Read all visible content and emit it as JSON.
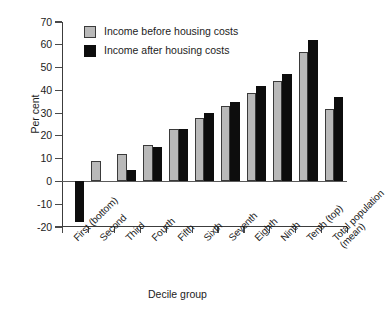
{
  "chart_data": {
    "type": "bar",
    "title": "",
    "xlabel": "Decile group",
    "ylabel": "Per cent",
    "ylim": [
      -20,
      70
    ],
    "yticks": [
      -20,
      -10,
      0,
      10,
      20,
      30,
      40,
      50,
      60,
      70
    ],
    "ytick_labels": [
      "-20",
      "-10",
      "0",
      "10",
      "20",
      "30",
      "40",
      "50",
      "60",
      "70"
    ],
    "grid": false,
    "legend_position": "top-left",
    "categories": [
      "First (bottom)",
      "Second",
      "Third",
      "Fourth",
      "Fifth",
      "Sixth",
      "Seventh",
      "Eighth",
      "Ninth",
      "Tenth (top)",
      "Total population (mean)"
    ],
    "series": [
      {
        "name": "Income before housing costs",
        "color": "#b9b9b9",
        "values": [
          0,
          9,
          12,
          16,
          23,
          28,
          33,
          39,
          44,
          57,
          32
        ]
      },
      {
        "name": "Income after housing costs",
        "color": "#0d0d0d",
        "values": [
          -18,
          0,
          5,
          15,
          23,
          30,
          35,
          42,
          47,
          62,
          37
        ]
      }
    ]
  },
  "legend": {
    "items": [
      {
        "label": "Income before housing costs",
        "key": "before"
      },
      {
        "label": "Income after housing costs",
        "key": "after"
      }
    ]
  }
}
